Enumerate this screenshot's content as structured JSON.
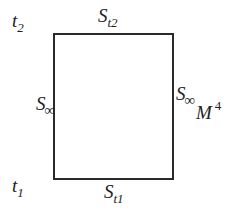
{
  "diagram": {
    "type": "spacetime-region",
    "region": {
      "shape": "rectangle",
      "stroke_color": "#2a2a2a",
      "fill_color": "#ffffff"
    },
    "time_labels": {
      "top": {
        "base": "t",
        "sub": "2"
      },
      "bottom": {
        "base": "t",
        "sub": "1"
      }
    },
    "boundary_labels": {
      "top": {
        "base": "S",
        "sub": "t2"
      },
      "bottom": {
        "base": "S",
        "sub": "t1"
      },
      "left": {
        "base": "S",
        "sub": "∞"
      },
      "right": {
        "base": "S",
        "sub": "∞"
      }
    },
    "manifold_label": {
      "base": "M",
      "sup": "4"
    }
  }
}
